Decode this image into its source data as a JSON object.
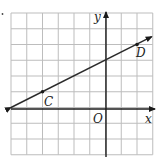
{
  "chart_data": {
    "type": "line",
    "title": "",
    "xlabel": "x",
    "ylabel": "y",
    "origin_label": "O",
    "grid": true,
    "xlim": [
      -6,
      3
    ],
    "ylim": [
      -3,
      6
    ],
    "grid_step": 1,
    "series": [
      {
        "name": "line CD",
        "equation": "y = 0.5x + 3",
        "x": [
          -6,
          3
        ],
        "y": [
          0,
          4.5
        ],
        "arrows": "both"
      }
    ],
    "points": [
      {
        "label": "C",
        "x": -4,
        "y": 1
      },
      {
        "label": "D",
        "x": 2,
        "y": 4
      }
    ]
  },
  "labels": {
    "x_axis": "x",
    "y_axis": "y",
    "origin": "O",
    "point_c": "C",
    "point_d": "D"
  },
  "colors": {
    "grid": "#bdbdbd",
    "axis": "#1a1a1a",
    "line": "#2a2a2a"
  }
}
